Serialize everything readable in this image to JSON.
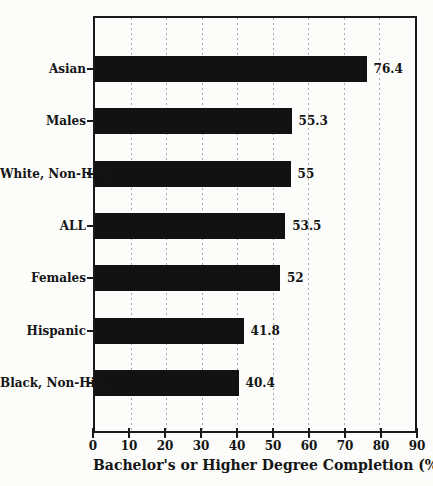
{
  "chart_data": {
    "type": "bar",
    "orientation": "horizontal",
    "xlabel": "Bachelor's or Higher Degree Completion (%)",
    "xlim": [
      0,
      90
    ],
    "xticks": [
      0,
      10,
      20,
      30,
      40,
      50,
      60,
      70,
      80,
      90
    ],
    "grid": "vertical-dotted",
    "legend": "none",
    "categories": [
      "Asian",
      "Males",
      "White, Non-Hisp",
      "ALL",
      "Females",
      "Hispanic",
      "Black, Non-Hisp"
    ],
    "values": [
      76.4,
      55.3,
      55,
      53.5,
      52,
      41.8,
      40.4
    ],
    "bar_labels": [
      "76.4",
      "55.3",
      "55",
      "53.5",
      "52",
      "41.8",
      "40.4"
    ],
    "colors": {
      "bar": "#121212",
      "frame": "#1a1a1a",
      "grid": "#a8a8a8",
      "text": "#141414",
      "background": "#fcfcfa"
    }
  }
}
